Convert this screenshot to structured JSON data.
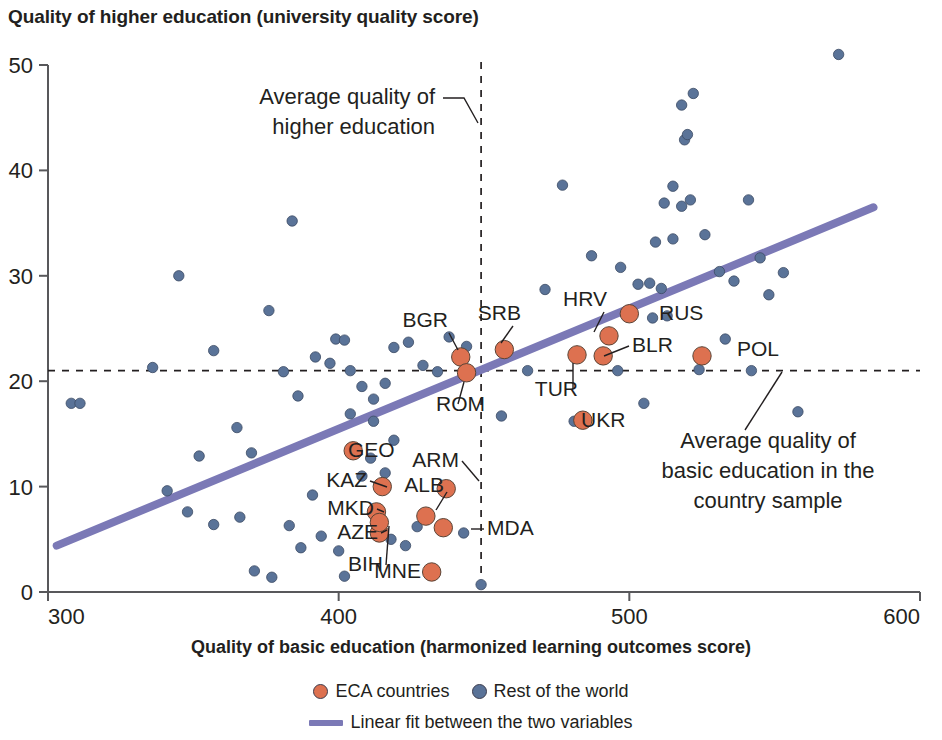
{
  "chart": {
    "title": "Quality of higher education (university quality score)",
    "x_axis_title": "Quality of basic education (harmonized learning outcomes score)"
  },
  "legend": {
    "items": [
      {
        "label": "ECA countries",
        "marker": "circle",
        "color": "#dd7150"
      },
      {
        "label": "Rest of the world",
        "marker": "circle",
        "color": "#5a7398"
      },
      {
        "label": "Linear fit between the two variables",
        "marker": "line",
        "color": "#7b79b6"
      }
    ]
  },
  "annotations": [
    {
      "id": "avg-higher-education",
      "lines": [
        "Average quality of",
        "higher education"
      ],
      "text": "Average quality of higher education"
    },
    {
      "id": "avg-basic-education",
      "lines": [
        "Average quality of",
        "basic education in the",
        "country sample"
      ],
      "text": "Average quality of basic education in the country sample"
    }
  ],
  "chart_data": {
    "type": "scatter",
    "title": "Quality of higher education (university quality score)",
    "xlabel": "Quality of basic education (harmonized learning outcomes score)",
    "ylabel": "Quality of higher education (university quality score)",
    "xlim": [
      300,
      600
    ],
    "ylim": [
      0,
      50
    ],
    "xticks": [
      300,
      400,
      500,
      600
    ],
    "yticks": [
      0,
      10,
      20,
      30,
      40,
      50
    ],
    "grid": false,
    "legend_position": "bottom",
    "reference_lines": [
      {
        "name": "Average quality of higher education",
        "orientation": "vertical",
        "value": 449,
        "style": "dashed"
      },
      {
        "name": "Average quality of basic education in the country sample",
        "orientation": "horizontal",
        "value": 21,
        "style": "dashed"
      }
    ],
    "fit_line": {
      "name": "Linear fit between the two variables",
      "color": "#7b79b6",
      "points": [
        [
          303,
          4.4
        ],
        [
          584,
          36.5
        ]
      ]
    },
    "series": [
      {
        "name": "ECA countries",
        "color": "#dd7150",
        "points": [
          {
            "label": "BGR",
            "x": 442,
            "y": 22.3
          },
          {
            "label": "ROM",
            "x": 444,
            "y": 20.8
          },
          {
            "label": "SRB",
            "x": 457,
            "y": 23.0
          },
          {
            "label": "TUR",
            "x": 482,
            "y": 22.5
          },
          {
            "label": "HRV",
            "x": 493,
            "y": 24.3
          },
          {
            "label": "BLR",
            "x": 491,
            "y": 22.4
          },
          {
            "label": "RUS",
            "x": 500,
            "y": 26.4
          },
          {
            "label": "UKR",
            "x": 484,
            "y": 16.3
          },
          {
            "label": "POL",
            "x": 525,
            "y": 22.4
          },
          {
            "label": "GEO",
            "x": 405,
            "y": 13.4
          },
          {
            "label": "KAZ",
            "x": 415,
            "y": 10.0
          },
          {
            "label": "ARM",
            "x": 437,
            "y": 9.8
          },
          {
            "label": "MKD",
            "x": 413,
            "y": 7.6
          },
          {
            "label": "ALB",
            "x": 430,
            "y": 7.2
          },
          {
            "label": "AZE",
            "x": 414,
            "y": 5.6
          },
          {
            "label": "BIH",
            "x": 414,
            "y": 6.6
          },
          {
            "label": "MDA",
            "x": 436,
            "y": 6.1
          },
          {
            "label": "MNE",
            "x": 432,
            "y": 1.9
          }
        ]
      },
      {
        "name": "Rest of the world",
        "color": "#5a7398",
        "points": [
          {
            "x": 308,
            "y": 17.9
          },
          {
            "x": 311,
            "y": 17.9
          },
          {
            "x": 345,
            "y": 30.0
          },
          {
            "x": 336,
            "y": 21.3
          },
          {
            "x": 357,
            "y": 22.9
          },
          {
            "x": 352,
            "y": 12.9
          },
          {
            "x": 365,
            "y": 15.6
          },
          {
            "x": 370,
            "y": 13.2
          },
          {
            "x": 376,
            "y": 26.7
          },
          {
            "x": 384,
            "y": 35.2
          },
          {
            "x": 381,
            "y": 20.9
          },
          {
            "x": 386,
            "y": 18.6
          },
          {
            "x": 392,
            "y": 22.3
          },
          {
            "x": 399,
            "y": 24.0
          },
          {
            "x": 402,
            "y": 23.9
          },
          {
            "x": 397,
            "y": 21.7
          },
          {
            "x": 404,
            "y": 21.0
          },
          {
            "x": 408,
            "y": 19.5
          },
          {
            "x": 412,
            "y": 18.3
          },
          {
            "x": 416,
            "y": 19.8
          },
          {
            "x": 419,
            "y": 23.2
          },
          {
            "x": 424,
            "y": 23.7
          },
          {
            "x": 429,
            "y": 21.5
          },
          {
            "x": 434,
            "y": 20.9
          },
          {
            "x": 438,
            "y": 24.2
          },
          {
            "x": 444,
            "y": 23.3
          },
          {
            "x": 341,
            "y": 9.6
          },
          {
            "x": 348,
            "y": 7.6
          },
          {
            "x": 357,
            "y": 6.4
          },
          {
            "x": 366,
            "y": 7.1
          },
          {
            "x": 371,
            "y": 2.0
          },
          {
            "x": 377,
            "y": 1.4
          },
          {
            "x": 383,
            "y": 6.3
          },
          {
            "x": 387,
            "y": 4.2
          },
          {
            "x": 394,
            "y": 5.3
          },
          {
            "x": 391,
            "y": 9.2
          },
          {
            "x": 400,
            "y": 3.9
          },
          {
            "x": 402,
            "y": 1.5
          },
          {
            "x": 408,
            "y": 11.0
          },
          {
            "x": 411,
            "y": 12.7
          },
          {
            "x": 416,
            "y": 11.3
          },
          {
            "x": 418,
            "y": 5.0
          },
          {
            "x": 423,
            "y": 4.4
          },
          {
            "x": 427,
            "y": 6.2
          },
          {
            "x": 412,
            "y": 16.2
          },
          {
            "x": 419,
            "y": 14.4
          },
          {
            "x": 404,
            "y": 16.9
          },
          {
            "x": 436,
            "y": 6.1
          },
          {
            "x": 443,
            "y": 5.6
          },
          {
            "x": 449,
            "y": 0.7
          },
          {
            "x": 456,
            "y": 16.7
          },
          {
            "x": 465,
            "y": 21.0
          },
          {
            "x": 471,
            "y": 28.7
          },
          {
            "x": 477,
            "y": 38.6
          },
          {
            "x": 481,
            "y": 16.2
          },
          {
            "x": 487,
            "y": 31.9
          },
          {
            "x": 497,
            "y": 30.8
          },
          {
            "x": 503,
            "y": 29.2
          },
          {
            "x": 507,
            "y": 29.3
          },
          {
            "x": 511,
            "y": 28.8
          },
          {
            "x": 508,
            "y": 26.0
          },
          {
            "x": 513,
            "y": 26.2
          },
          {
            "x": 496,
            "y": 21.0
          },
          {
            "x": 505,
            "y": 17.9
          },
          {
            "x": 509,
            "y": 33.2
          },
          {
            "x": 515,
            "y": 33.5
          },
          {
            "x": 512,
            "y": 36.9
          },
          {
            "x": 518,
            "y": 36.6
          },
          {
            "x": 521,
            "y": 37.2
          },
          {
            "x": 515,
            "y": 38.5
          },
          {
            "x": 519,
            "y": 42.9
          },
          {
            "x": 520,
            "y": 43.4
          },
          {
            "x": 518,
            "y": 46.2
          },
          {
            "x": 522,
            "y": 47.3
          },
          {
            "x": 526,
            "y": 33.9
          },
          {
            "x": 531,
            "y": 30.4
          },
          {
            "x": 536,
            "y": 29.5
          },
          {
            "x": 524,
            "y": 21.1
          },
          {
            "x": 533,
            "y": 24.0
          },
          {
            "x": 541,
            "y": 37.2
          },
          {
            "x": 545,
            "y": 31.7
          },
          {
            "x": 548,
            "y": 28.2
          },
          {
            "x": 553,
            "y": 30.3
          },
          {
            "x": 558,
            "y": 17.1
          },
          {
            "x": 542,
            "y": 21.0
          },
          {
            "x": 572,
            "y": 51.0
          }
        ]
      }
    ]
  }
}
